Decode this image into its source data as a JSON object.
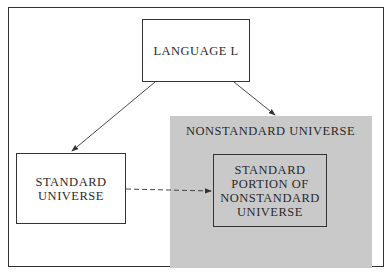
{
  "diagram": {
    "nodes": {
      "language": "LANGUAGE L",
      "nonstandard_universe": "NONSTANDARD UNIVERSE",
      "standard_universe": [
        "STANDARD",
        "UNIVERSE"
      ],
      "standard_portion": [
        "STANDARD",
        "PORTION OF",
        "NONSTANDARD",
        "UNIVERSE"
      ]
    },
    "edges": [
      {
        "from": "LANGUAGE L",
        "to": "STANDARD UNIVERSE",
        "style": "solid"
      },
      {
        "from": "LANGUAGE L",
        "to": "NONSTANDARD UNIVERSE",
        "style": "solid"
      },
      {
        "from": "STANDARD UNIVERSE",
        "to": "STANDARD PORTION OF NONSTANDARD UNIVERSE",
        "style": "dashed"
      }
    ],
    "colors": {
      "shaded_region": "#c9c9c9",
      "lines": "#333333"
    }
  }
}
